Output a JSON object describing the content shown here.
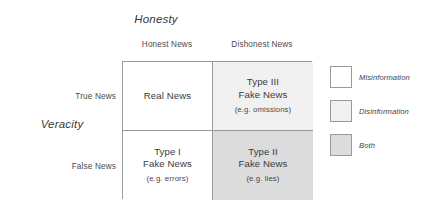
{
  "diagram": {
    "x_axis_title": "Honesty",
    "y_axis_title": "Veracity",
    "columns": [
      {
        "label": "Honest News"
      },
      {
        "label": "Dishonest News"
      }
    ],
    "rows": [
      {
        "label": "True News"
      },
      {
        "label": "False News"
      }
    ],
    "cells": [
      {
        "line1": "Real News",
        "line2": "",
        "example": "",
        "fill": "#ffffff",
        "category": "misinformation"
      },
      {
        "line1": "Type III",
        "line2": "Fake News",
        "example": "(e.g. omissions)",
        "fill": "#f1f1f1",
        "category": "disinformation"
      },
      {
        "line1": "Type I",
        "line2": "Fake News",
        "example": "(e.g. errors)",
        "fill": "#ffffff",
        "category": "misinformation"
      },
      {
        "line1": "Type II",
        "line2": "Fake News",
        "example": "(e.g. lies)",
        "fill": "#dcdcdc",
        "category": "both"
      }
    ],
    "legend": [
      {
        "label": "Misinformation",
        "color": "#ffffff"
      },
      {
        "label": "Disinformation",
        "color": "#f1f1f1"
      },
      {
        "label": "Both",
        "color": "#dcdcdc"
      }
    ],
    "colors": {
      "border": "#9a9a9a",
      "text": "#3f3f3f",
      "background": "#ffffff"
    }
  }
}
